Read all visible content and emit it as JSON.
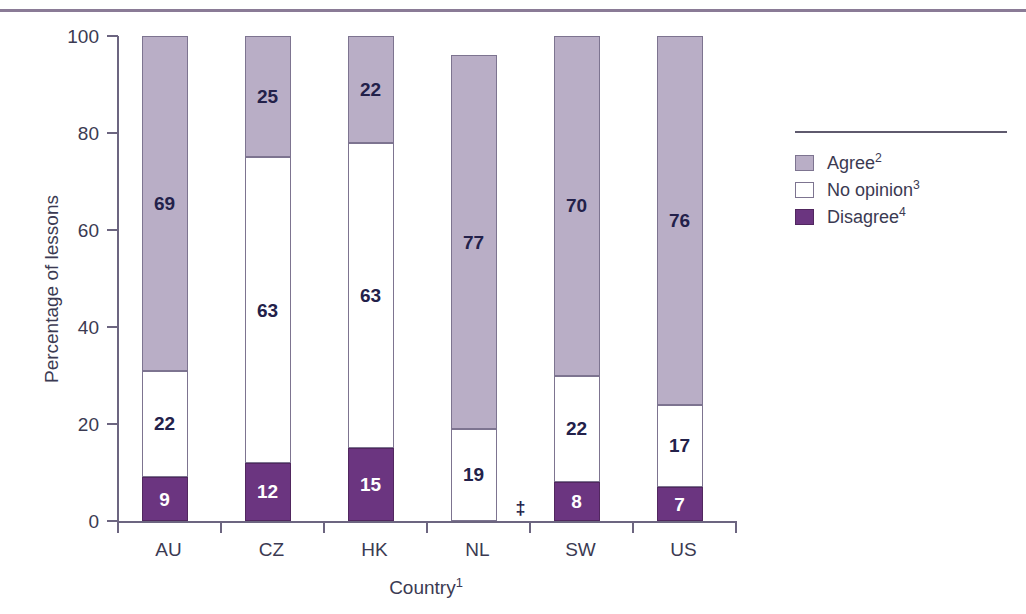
{
  "chart_data": {
    "type": "bar",
    "subtype": "stacked-vertical-100",
    "title": "",
    "xlabel": "Country",
    "xlabel_footnote": "1",
    "ylabel": "Percentage of lessons",
    "ylim": [
      0,
      100
    ],
    "yticks": [
      0,
      20,
      40,
      60,
      80,
      100
    ],
    "ytick_labels": [
      "0",
      "20",
      "40",
      "60",
      "80",
      "100"
    ],
    "grid": false,
    "legend_position": "right",
    "categories": [
      "AU",
      "CZ",
      "HK",
      "NL",
      "SW",
      "US"
    ],
    "series": [
      {
        "name": "Agree",
        "footnote": "2",
        "color": "#b9aec6",
        "values": [
          69,
          25,
          22,
          77,
          70,
          76
        ],
        "labels": [
          "69",
          "25",
          "22",
          "77",
          "70",
          "76"
        ]
      },
      {
        "name": "No opinion",
        "footnote": "3",
        "color": "#ffffff",
        "values": [
          22,
          63,
          63,
          19,
          22,
          17
        ],
        "labels": [
          "22",
          "63",
          "63",
          "19",
          "22",
          "17"
        ]
      },
      {
        "name": "Disagree",
        "footnote": "4",
        "color": "#6b3580",
        "values": [
          9,
          12,
          15,
          null,
          8,
          7
        ],
        "labels": [
          "9",
          "12",
          "15",
          "",
          "8",
          "7"
        ]
      }
    ],
    "totals": [
      100,
      100,
      100,
      96,
      100,
      100
    ],
    "annotations": [
      {
        "symbol": "‡",
        "category": "NL",
        "meaning": "reporting-standards-not-met"
      }
    ]
  },
  "legend": {
    "items": [
      {
        "label": "Agree",
        "footnote": "2",
        "swatch": "agree-swatch"
      },
      {
        "label": "No opinion",
        "footnote": "3",
        "swatch": "no-opinion-swatch"
      },
      {
        "label": "Disagree",
        "footnote": "4",
        "swatch": "disagree-swatch"
      }
    ]
  },
  "axis": {
    "y_title": "Percentage of lessons",
    "x_title": "Country",
    "x_title_footnote": "1"
  }
}
